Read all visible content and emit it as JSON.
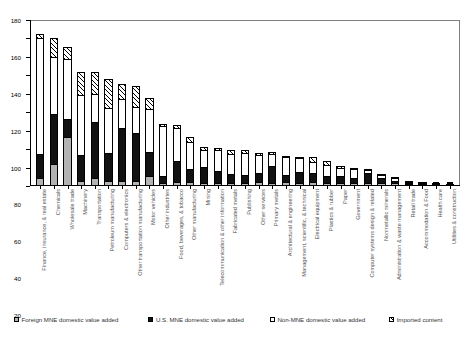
{
  "chart_data": {
    "type": "bar",
    "stacked": true,
    "title": "",
    "xlabel": "",
    "ylabel": "",
    "ylim": [
      0,
      180
    ],
    "ytick_step": 20,
    "ytick_labels": [
      "0",
      "20",
      "40",
      "60",
      "80",
      "100",
      "120",
      "140",
      "160",
      "180"
    ],
    "grid": false,
    "legend_position": "bottom",
    "series": [
      {
        "name": "Foreign MNE domestic value added",
        "color": "#b3b3b3",
        "pattern": "light-gray",
        "values": [
          7,
          22,
          52,
          3,
          7,
          3,
          3,
          3,
          9,
          1,
          2,
          2,
          1,
          1,
          1,
          1,
          2,
          1,
          2,
          1,
          2,
          1,
          1,
          1,
          1,
          1,
          1,
          0.5,
          0.5,
          0.5,
          0.3
        ]
      },
      {
        "name": "U.S. MNE domestic value added",
        "color": "#111111",
        "pattern": "solid-black",
        "values": [
          26,
          55,
          20,
          29,
          61,
          31,
          59,
          54,
          27,
          8,
          24,
          15,
          18,
          14,
          10,
          9,
          11,
          20,
          8,
          13,
          11,
          8,
          9,
          6,
          13,
          8,
          3,
          1.5,
          1,
          1,
          0.5
        ]
      },
      {
        "name": "Non-MNE domestic value added",
        "color": "#ffffff",
        "pattern": "white",
        "values": [
          128,
          63,
          66,
          66,
          31,
          50,
          32,
          28,
          47,
          56,
          37,
          30,
          20,
          24,
          24,
          26,
          21,
          14,
          22,
          16,
          13,
          14,
          9,
          11,
          3,
          4,
          5,
          3,
          2.5,
          1.5,
          1.5
        ]
      },
      {
        "name": "Imported content",
        "color": "#ffffff",
        "pattern": "diagonal-hatch",
        "values": [
          4,
          21,
          13,
          26,
          25,
          32,
          17,
          23,
          12,
          2,
          3,
          6,
          3,
          2,
          4,
          3,
          2,
          2,
          1,
          1,
          5,
          4,
          3,
          1,
          1,
          0.5,
          0.5,
          0.5,
          0.3,
          0.3,
          0.2
        ]
      }
    ],
    "categories": [
      "Finance, insurance, & real estate",
      "Chemicals",
      "Wholesale trade",
      "Machinery",
      "Transportation",
      "Petroleum manufacturing",
      "Computers & electronics",
      "Other transportation manufacturing",
      "Motor vehicles",
      "Other industries",
      "Food, beverages, & tobacco",
      "Other manufacturing",
      "Mining",
      "Telecommunication & other information",
      "Fabricated metals",
      "Publishing",
      "Other services",
      "Primary metals",
      "Architectural & engineering",
      "Management, scientific, & technical",
      "Electrical equipment",
      "Plastics & rubber",
      "Paper",
      "Government",
      "Computer systems design & related",
      "Nonmetallic minerals",
      "Administration & waste management",
      "Retail trade",
      "Accommodation & Food",
      "Health care",
      "Utilities & construction"
    ],
    "totals": [
      165,
      161,
      151,
      124,
      124,
      116,
      111,
      108,
      95,
      67,
      66,
      53,
      42,
      41,
      39,
      39,
      36,
      37,
      33,
      31,
      31,
      27,
      22,
      19,
      18,
      13.5,
      9.5,
      5.5,
      4.3,
      3.3,
      2.5
    ]
  },
  "legend": {
    "items": [
      {
        "label": "Foreign MNE domestic value added",
        "swatch": "foreign"
      },
      {
        "label": "U.S. MNE domestic value added",
        "swatch": "usmne"
      },
      {
        "label": "Non-MNE domestic value added",
        "swatch": "nonmne"
      },
      {
        "label": "Imported content",
        "swatch": "imported"
      }
    ]
  }
}
